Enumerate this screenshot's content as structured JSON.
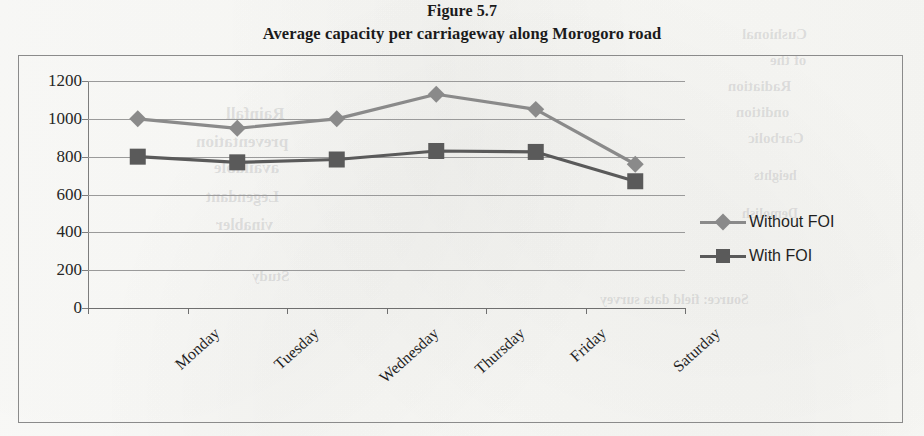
{
  "figure": {
    "label": "Figure 5.7",
    "title": "Average capacity per carriageway along Morogoro road"
  },
  "colors": {
    "without_foi": "#8a8a8a",
    "with_foi": "#5a5a5a",
    "gridline": "#9a9a9a",
    "axis": "#6f6f6f",
    "frame": "#8b8b8b",
    "text": "#1f1f1f"
  },
  "legend": {
    "position": "right",
    "entries": [
      {
        "label": "Without FOI",
        "marker": "diamond",
        "color": "#8a8a8a"
      },
      {
        "label": "With FOI",
        "marker": "square",
        "color": "#5a5a5a"
      }
    ]
  },
  "ghost_text": [
    {
      "text": "Cushional",
      "x": 742,
      "y": 26,
      "size": 15
    },
    {
      "text": "of the",
      "x": 770,
      "y": 52,
      "size": 15
    },
    {
      "text": "Radiation",
      "x": 728,
      "y": 78,
      "size": 15
    },
    {
      "text": "ondition",
      "x": 736,
      "y": 104,
      "size": 15
    },
    {
      "text": "Carbolic",
      "x": 748,
      "y": 130,
      "size": 15
    },
    {
      "text": "heights",
      "x": 754,
      "y": 168,
      "size": 14
    },
    {
      "text": "Demolish",
      "x": 742,
      "y": 206,
      "size": 14
    },
    {
      "text": "Source: field data survey",
      "x": 600,
      "y": 292,
      "size": 14
    },
    {
      "text": "Rainfall",
      "x": 226,
      "y": 104,
      "size": 17
    },
    {
      "text": "preventation",
      "x": 196,
      "y": 132,
      "size": 17
    },
    {
      "text": "available",
      "x": 214,
      "y": 158,
      "size": 17
    },
    {
      "text": "Legendant",
      "x": 206,
      "y": 188,
      "size": 16
    },
    {
      "text": "vinabler",
      "x": 216,
      "y": 216,
      "size": 16
    },
    {
      "text": "Study",
      "x": 252,
      "y": 268,
      "size": 15
    }
  ],
  "chart_data": {
    "type": "line",
    "title": "Average capacity per carriageway along Morogoro road",
    "xlabel": "",
    "ylabel": "",
    "categories": [
      "Monday",
      "Tuesday",
      "Wednesday",
      "Thursday",
      "Friday",
      "Saturday"
    ],
    "series": [
      {
        "name": "Without FOI",
        "marker": "diamond",
        "color": "#8a8a8a",
        "values": [
          1000,
          950,
          1000,
          1130,
          1050,
          760
        ]
      },
      {
        "name": "With FOI",
        "marker": "square",
        "color": "#5a5a5a",
        "values": [
          800,
          770,
          785,
          830,
          825,
          670
        ]
      }
    ],
    "ylim": [
      0,
      1200
    ],
    "yticks": [
      0,
      200,
      400,
      600,
      800,
      1000,
      1200
    ],
    "ytick_labels": [
      "0",
      "200",
      "400",
      "600",
      "800",
      "1000",
      "1200"
    ],
    "grid": true,
    "grid_axis": "y",
    "legend_position": "right"
  }
}
